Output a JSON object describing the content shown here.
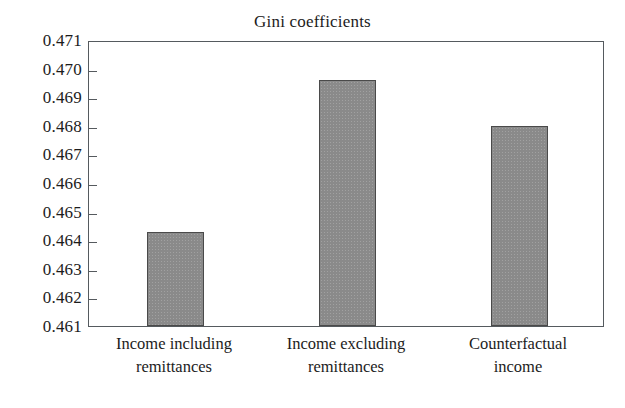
{
  "chart_data": {
    "type": "bar",
    "title": "Gini coefficients",
    "xlabel": "",
    "ylabel": "",
    "categories": [
      "Income including remittances",
      "Income excluding remittances",
      "Counterfactual income"
    ],
    "category_lines": [
      [
        "Income including",
        "remittances"
      ],
      [
        "Income excluding",
        "remittances"
      ],
      [
        "Counterfactual",
        "income"
      ]
    ],
    "values": [
      0.4643,
      0.4696,
      0.468
    ],
    "ylim": [
      0.461,
      0.471
    ],
    "ytick_labels": [
      "0.471",
      "0.470",
      "0.469",
      "0.468",
      "0.467",
      "0.466",
      "0.465",
      "0.464",
      "0.463",
      "0.462",
      "0.461"
    ],
    "ytick_values": [
      0.471,
      0.47,
      0.469,
      0.468,
      0.467,
      0.466,
      0.465,
      0.464,
      0.463,
      0.462,
      0.461
    ],
    "grid": false,
    "legend": false,
    "legend_position": "none",
    "bar_fill_color": "#8a8a8a",
    "bar_edge_color": "#4a4a4a",
    "axis_color": "#555a5e",
    "background_color": "#ffffff",
    "text_color": "#1c1c1c"
  }
}
